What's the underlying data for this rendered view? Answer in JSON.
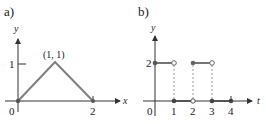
{
  "panels": [
    {
      "label": "a)",
      "y_axis_label": "y",
      "x_axis_label": "x",
      "origin_label": "0",
      "y_tick_label": "1",
      "x_tick_label": "2",
      "peak_label": "(1, 1)",
      "points": [
        [
          0,
          0
        ],
        [
          1,
          1
        ],
        [
          2,
          0
        ]
      ]
    },
    {
      "label": "b)",
      "y_axis_label": "y",
      "x_axis_label": "t",
      "origin_label": "0",
      "y_tick_label": "2",
      "x_tick_labels": [
        "1",
        "2",
        "3",
        "4"
      ],
      "segments": [
        {
          "from": [
            0,
            2
          ],
          "to": [
            1,
            2
          ],
          "start": "closed",
          "end": "open"
        },
        {
          "from": [
            1,
            0
          ],
          "to": [
            2,
            0
          ],
          "start": "closed",
          "end": "open"
        },
        {
          "from": [
            2,
            2
          ],
          "to": [
            3,
            2
          ],
          "start": "closed",
          "end": "open"
        },
        {
          "from": [
            3,
            0
          ],
          "to": [
            4,
            0
          ],
          "start": "closed",
          "end": "closed"
        }
      ]
    }
  ],
  "colors": {
    "axis": "#333333",
    "graph": "#808080",
    "dot": "#555555",
    "dashed": "#888888"
  }
}
